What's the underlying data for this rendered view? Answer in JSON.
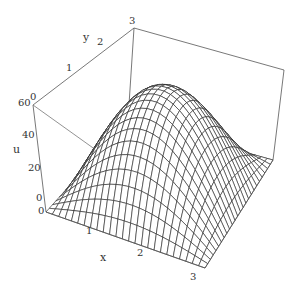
{
  "chart_data": {
    "type": "surface3d",
    "title": "",
    "function": "u = 60*sin(x)*sin(pi*y/3)",
    "xlabel": "x",
    "ylabel": "y",
    "zlabel": "u",
    "xlim": [
      0,
      3.14159
    ],
    "ylim": [
      0,
      3
    ],
    "zlim": [
      0,
      60
    ],
    "x_ticks": [
      "0",
      "1",
      "2",
      "3"
    ],
    "y_ticks": [
      "0",
      "1",
      "2",
      "3"
    ],
    "z_ticks": [
      "0",
      "20",
      "40",
      "60"
    ],
    "grid_x": 25,
    "grid_y": 25,
    "peak": {
      "x": 1.5708,
      "y": 1.5,
      "u": 60
    }
  },
  "labels": {
    "x_axis": "x",
    "y_axis": "y",
    "z_axis": "u",
    "x0": "0",
    "x1": "1",
    "x2": "2",
    "x3": "3",
    "y0": "0",
    "y1": "1",
    "y2": "2",
    "y3": "3",
    "z0": "0",
    "z20": "20",
    "z40": "40",
    "z60": "60"
  }
}
